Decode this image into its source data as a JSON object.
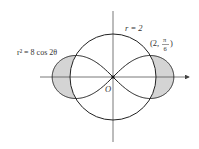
{
  "diagram": {
    "labels": {
      "circle": "r = 2",
      "lemniscate": "r² = 8 cos 2θ",
      "point_open": "(2,",
      "point_num": "π",
      "point_den": "6",
      "point_close": ")",
      "origin": "O"
    },
    "colors": {
      "stroke": "#222222",
      "shade": "#d4d4d4",
      "axis": "#555555"
    },
    "geometry": {
      "origin_px": [
        113,
        77
      ],
      "unit_px": 21.5,
      "circle_radius": 2,
      "lemniscate_a2": 8
    }
  }
}
